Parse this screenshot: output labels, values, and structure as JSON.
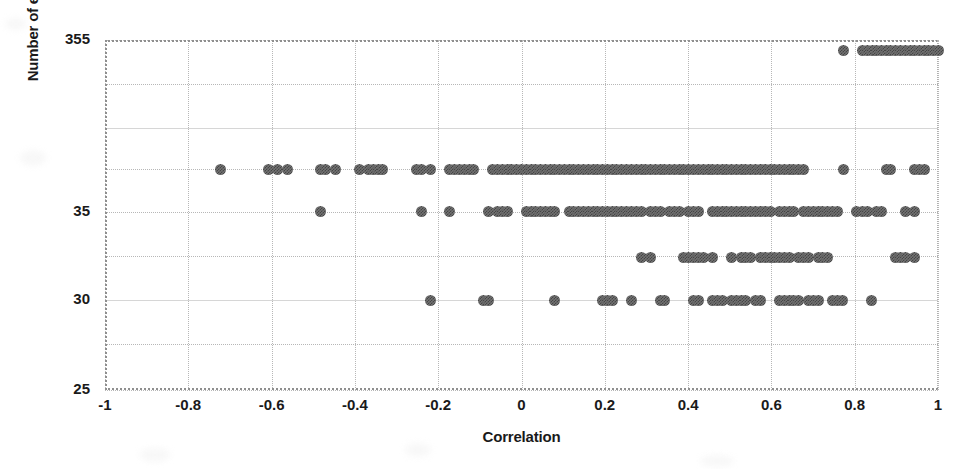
{
  "chart_data": {
    "type": "scatter",
    "title": "",
    "xlabel": "Correlation",
    "ylabel": "Number of elements",
    "xlim": [
      -1,
      1
    ],
    "ylim": [
      25,
      355
    ],
    "grid": true,
    "legend": null,
    "xticks": [
      "-1",
      "-0.8",
      "-0.6",
      "-0.4",
      "-0.2",
      "0",
      "0.2",
      "0.4",
      "0.6",
      "0.8",
      "1"
    ],
    "xtick_values": [
      -1,
      -0.8,
      -0.6,
      -0.4,
      -0.2,
      0,
      0.2,
      0.4,
      0.6,
      0.8,
      1
    ],
    "yticks": [
      "355",
      "35",
      "30",
      "25"
    ],
    "ytick_values": [
      355,
      35,
      30,
      25
    ],
    "ytick_positions_frac": [
      0.0,
      0.492,
      0.743,
      1.0
    ],
    "gridline_fracs": [
      0.0,
      0.126,
      0.251,
      0.368,
      0.492,
      0.617,
      0.743,
      0.868,
      1.0
    ],
    "marker": {
      "shape": "circle",
      "color": "#727272",
      "pattern": "checkered-gray",
      "size_px": 11
    },
    "note": "Y axis is non-linear / broken: labeled ticks 355, 35, 30, 25. Points lie on discrete element-count rows.",
    "series": [
      {
        "name": "elements-355",
        "y_value": 355,
        "y_frac": 0.0286,
        "x": [
          0.772,
          0.818,
          0.83,
          0.842,
          0.853,
          0.864,
          0.876,
          0.887,
          0.899,
          0.91,
          0.921,
          0.933,
          0.944,
          0.955,
          0.967,
          0.978,
          0.989,
          1.0
        ]
      },
      {
        "name": "elements-33",
        "y_value": 33,
        "y_frac": 0.3714,
        "x": [
          -0.723,
          -0.608,
          -0.585,
          -0.562,
          -0.482,
          -0.47,
          -0.447,
          -0.39,
          -0.367,
          -0.356,
          -0.344,
          -0.333,
          -0.252,
          -0.241,
          -0.218,
          -0.172,
          -0.16,
          -0.149,
          -0.138,
          -0.126,
          -0.115,
          -0.069,
          -0.057,
          -0.046,
          -0.034,
          -0.023,
          -0.011,
          0.0,
          0.011,
          0.023,
          0.034,
          0.046,
          0.057,
          0.069,
          0.08,
          0.092,
          0.103,
          0.115,
          0.126,
          0.138,
          0.149,
          0.16,
          0.172,
          0.183,
          0.195,
          0.206,
          0.218,
          0.229,
          0.241,
          0.252,
          0.264,
          0.275,
          0.287,
          0.298,
          0.31,
          0.321,
          0.333,
          0.344,
          0.356,
          0.367,
          0.379,
          0.39,
          0.402,
          0.413,
          0.425,
          0.436,
          0.448,
          0.459,
          0.47,
          0.482,
          0.493,
          0.505,
          0.516,
          0.528,
          0.539,
          0.551,
          0.562,
          0.574,
          0.585,
          0.597,
          0.608,
          0.62,
          0.631,
          0.643,
          0.654,
          0.666,
          0.677,
          0.772,
          0.876,
          0.887,
          0.944,
          0.955,
          0.967
        ]
      },
      {
        "name": "elements-32",
        "y_value": 32,
        "y_frac": 0.4914,
        "x": [
          -0.482,
          -0.241,
          -0.172,
          -0.08,
          -0.057,
          -0.046,
          -0.034,
          0.011,
          0.023,
          0.034,
          0.046,
          0.057,
          0.069,
          0.08,
          0.115,
          0.126,
          0.138,
          0.149,
          0.16,
          0.172,
          0.183,
          0.195,
          0.206,
          0.218,
          0.229,
          0.241,
          0.252,
          0.264,
          0.275,
          0.287,
          0.31,
          0.321,
          0.333,
          0.356,
          0.367,
          0.379,
          0.402,
          0.413,
          0.425,
          0.459,
          0.47,
          0.482,
          0.493,
          0.505,
          0.516,
          0.528,
          0.539,
          0.551,
          0.562,
          0.574,
          0.585,
          0.597,
          0.62,
          0.631,
          0.643,
          0.654,
          0.677,
          0.689,
          0.7,
          0.712,
          0.723,
          0.735,
          0.746,
          0.758,
          0.805,
          0.818,
          0.83,
          0.853,
          0.864,
          0.921,
          0.944
        ]
      },
      {
        "name": "elements-31",
        "y_value": 31,
        "y_frac": 0.62,
        "x": [
          0.287,
          0.31,
          0.39,
          0.402,
          0.413,
          0.425,
          0.436,
          0.459,
          0.505,
          0.528,
          0.539,
          0.551,
          0.574,
          0.585,
          0.597,
          0.608,
          0.62,
          0.631,
          0.643,
          0.666,
          0.677,
          0.689,
          0.712,
          0.723,
          0.735,
          0.899,
          0.91,
          0.921,
          0.944
        ]
      },
      {
        "name": "elements-30",
        "y_value": 30,
        "y_frac": 0.7429,
        "x": [
          -0.218,
          -0.092,
          -0.08,
          0.08,
          0.195,
          0.206,
          0.218,
          0.264,
          0.333,
          0.344,
          0.413,
          0.425,
          0.459,
          0.47,
          0.482,
          0.505,
          0.516,
          0.528,
          0.539,
          0.562,
          0.574,
          0.62,
          0.631,
          0.643,
          0.654,
          0.666,
          0.689,
          0.7,
          0.712,
          0.746,
          0.758,
          0.77,
          0.84
        ]
      }
    ]
  }
}
